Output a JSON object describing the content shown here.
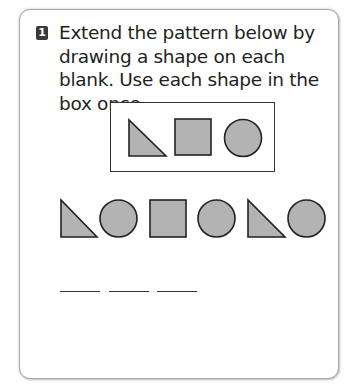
{
  "question": {
    "number": "1",
    "text": "Extend the pattern below by drawing a shape on each blank. Use each shape in the box once."
  },
  "shape_box": {
    "shapes": [
      "right-triangle",
      "square",
      "circle"
    ]
  },
  "pattern": {
    "sequence": [
      "right-triangle",
      "circle",
      "square",
      "circle",
      "right-triangle",
      "circle"
    ]
  },
  "blanks": {
    "count": 3
  },
  "colors": {
    "shape_fill": "#b3b3b3",
    "shape_stroke": "#222222",
    "badge_bg": "#3a3a3a",
    "text": "#231f20"
  }
}
